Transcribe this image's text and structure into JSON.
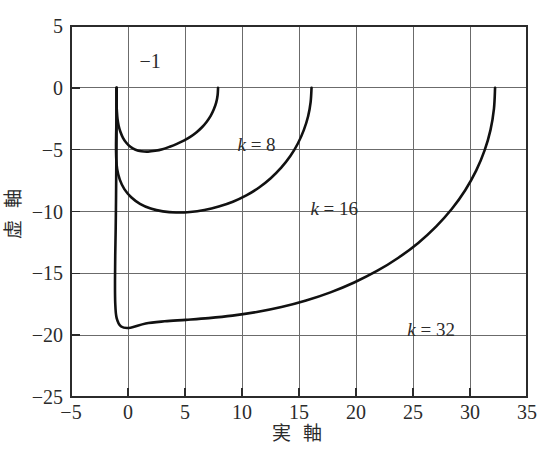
{
  "chart_data": {
    "type": "line",
    "title": "",
    "xlabel": "実 軸",
    "ylabel": "虚 軸",
    "xlim": [
      -5,
      35
    ],
    "ylim": [
      -25,
      5
    ],
    "xticks": [
      -5,
      0,
      5,
      10,
      15,
      20,
      25,
      30,
      35
    ],
    "yticks": [
      5,
      0,
      -5,
      -10,
      -15,
      -20,
      -25
    ],
    "xtick_labels": [
      "−5",
      "0",
      "5",
      "10",
      "15",
      "20",
      "25",
      "30",
      "35"
    ],
    "ytick_labels": [
      "5",
      "0",
      "−5",
      "−10",
      "−15",
      "−20",
      "−25"
    ],
    "grid": true,
    "legend_position": "inline-annotations",
    "annotations": [
      {
        "name": "critical-point",
        "text": "−1",
        "x": 1.0,
        "y": 2.1
      },
      {
        "name": "k8-label",
        "text": "k = 8",
        "x": 9.6,
        "y": -4.6
      },
      {
        "name": "k16-label",
        "text": "k = 16",
        "x": 16.0,
        "y": -9.8
      },
      {
        "name": "k32-label",
        "text": "k = 32",
        "x": 24.5,
        "y": -19.6
      }
    ],
    "series": [
      {
        "name": "k = 8",
        "label_math": "k=8",
        "k": 8,
        "color": "#111111",
        "start": [
          7.9,
          0.0
        ],
        "end": [
          -1.0,
          0.0
        ],
        "min_imag": -5.2,
        "min_imag_at_real": 3.0,
        "points": [
          [
            7.9,
            0.0
          ],
          [
            7.86,
            -0.6
          ],
          [
            7.74,
            -1.18
          ],
          [
            7.53,
            -1.74
          ],
          [
            7.25,
            -2.27
          ],
          [
            6.89,
            -2.76
          ],
          [
            6.47,
            -3.21
          ],
          [
            5.99,
            -3.61
          ],
          [
            5.46,
            -3.97
          ],
          [
            4.89,
            -4.27
          ],
          [
            4.29,
            -4.53
          ],
          [
            3.66,
            -4.76
          ],
          [
            3.02,
            -4.96
          ],
          [
            2.38,
            -5.09
          ],
          [
            1.76,
            -5.16
          ],
          [
            1.18,
            -5.13
          ],
          [
            0.66,
            -5.0
          ],
          [
            0.21,
            -4.77
          ],
          [
            -0.15,
            -4.44
          ],
          [
            -0.44,
            -4.04
          ],
          [
            -0.66,
            -3.57
          ],
          [
            -0.82,
            -3.06
          ],
          [
            -0.92,
            -2.52
          ],
          [
            -0.97,
            -1.96
          ],
          [
            -1.0,
            -1.38
          ],
          [
            -1.0,
            -0.8
          ],
          [
            -1.0,
            -0.28
          ],
          [
            -1.0,
            0.0
          ]
        ]
      },
      {
        "name": "k = 16",
        "label_math": "k=16",
        "k": 16,
        "color": "#111111",
        "start": [
          16.1,
          0.0
        ],
        "end": [
          -1.0,
          0.0
        ],
        "min_imag": -10.1,
        "min_imag_at_real": 5.6,
        "points": [
          [
            16.1,
            0.0
          ],
          [
            16.02,
            -1.15
          ],
          [
            15.8,
            -2.3
          ],
          [
            15.42,
            -3.42
          ],
          [
            14.9,
            -4.5
          ],
          [
            14.24,
            -5.52
          ],
          [
            13.44,
            -6.46
          ],
          [
            12.52,
            -7.31
          ],
          [
            11.5,
            -8.06
          ],
          [
            10.38,
            -8.7
          ],
          [
            9.2,
            -9.21
          ],
          [
            7.96,
            -9.6
          ],
          [
            6.7,
            -9.88
          ],
          [
            5.44,
            -10.04
          ],
          [
            4.22,
            -10.08
          ],
          [
            3.06,
            -9.99
          ],
          [
            1.99,
            -9.76
          ],
          [
            1.05,
            -9.38
          ],
          [
            0.28,
            -8.85
          ],
          [
            -0.32,
            -8.19
          ],
          [
            -0.72,
            -7.42
          ],
          [
            -0.95,
            -6.58
          ],
          [
            -1.03,
            -5.7
          ],
          [
            -1.05,
            -4.78
          ],
          [
            -1.04,
            -3.84
          ],
          [
            -1.02,
            -2.88
          ],
          [
            -1.01,
            -1.9
          ],
          [
            -1.0,
            -0.94
          ],
          [
            -1.0,
            0.0
          ]
        ]
      },
      {
        "name": "k = 32",
        "label_math": "k=32",
        "k": 32,
        "color": "#111111",
        "start": [
          32.2,
          0.0
        ],
        "end": [
          -1.0,
          0.0
        ],
        "min_imag": -20.2,
        "min_imag_at_real": 12.0,
        "points": [
          [
            32.2,
            0.0
          ],
          [
            32.1,
            -1.7
          ],
          [
            31.8,
            -3.4
          ],
          [
            31.28,
            -5.06
          ],
          [
            30.54,
            -6.7
          ],
          [
            29.58,
            -8.28
          ],
          [
            28.4,
            -9.8
          ],
          [
            27.02,
            -11.22
          ],
          [
            25.46,
            -12.54
          ],
          [
            23.72,
            -13.74
          ],
          [
            21.84,
            -14.81
          ],
          [
            19.84,
            -15.74
          ],
          [
            17.76,
            -16.54
          ],
          [
            15.62,
            -17.2
          ],
          [
            13.46,
            -17.73
          ],
          [
            11.3,
            -18.13
          ],
          [
            9.16,
            -18.42
          ],
          [
            7.08,
            -18.62
          ],
          [
            5.08,
            -18.76
          ],
          [
            3.22,
            -18.88
          ],
          [
            1.55,
            -19.05
          ],
          [
            0.22,
            -19.4
          ],
          [
            -0.6,
            -19.3
          ],
          [
            -1.0,
            -18.6
          ],
          [
            -1.12,
            -17.4
          ],
          [
            -1.14,
            -15.6
          ],
          [
            -1.12,
            -13.6
          ],
          [
            -1.08,
            -11.4
          ],
          [
            -1.05,
            -9.0
          ],
          [
            -1.03,
            -6.6
          ],
          [
            -1.01,
            -4.2
          ],
          [
            -1.0,
            -1.9
          ],
          [
            -1.0,
            0.0
          ]
        ]
      }
    ]
  },
  "figure": {
    "background": "#ffffff",
    "grid_color": "#6b6b6b",
    "frame_color": "#2b2b2b",
    "curve_color": "#111111"
  }
}
